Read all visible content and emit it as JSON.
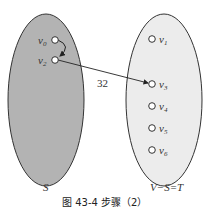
{
  "diagram": {
    "sets": [
      {
        "id": "S",
        "label": "S",
        "fill": "#b3b3b3"
      },
      {
        "id": "T",
        "label": "V−S=T",
        "fill": "#ececec"
      }
    ],
    "nodes": {
      "S": [
        {
          "name": "v",
          "sub": "0"
        },
        {
          "name": "v",
          "sub": "2"
        }
      ],
      "T": [
        {
          "name": "v",
          "sub": "1"
        },
        {
          "name": "v",
          "sub": "3"
        },
        {
          "name": "v",
          "sub": "4"
        },
        {
          "name": "v",
          "sub": "5"
        },
        {
          "name": "v",
          "sub": "6"
        }
      ]
    },
    "edges": [
      {
        "from": "v0",
        "to": "v2",
        "weight": ""
      },
      {
        "from": "v2",
        "to": "v3",
        "weight": "32"
      }
    ],
    "edge_weight_label": "32",
    "caption": "图 43-4   步骤（2）"
  }
}
